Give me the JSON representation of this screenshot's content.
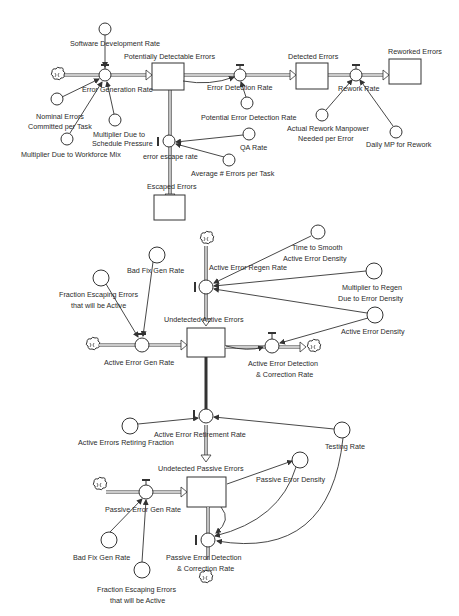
{
  "diagram": {
    "type": "system-dynamics-stock-flow",
    "section_top": {
      "stocks": [
        {
          "id": "pde",
          "label": "Potentially Detectable Errors"
        },
        {
          "id": "de",
          "label": "Detected Errors"
        },
        {
          "id": "re",
          "label": "Reworked Errors"
        },
        {
          "id": "ee",
          "label": "Escaped Errors"
        }
      ],
      "flows": [
        {
          "id": "egr",
          "label": "Error Generation Rate"
        },
        {
          "id": "edr",
          "label": "Error Detection Rate"
        },
        {
          "id": "rr",
          "label": "Rework Rate"
        },
        {
          "id": "eer",
          "label": "error escape rate"
        }
      ],
      "auxiliaries": [
        {
          "id": "sdr",
          "label": "Software Development Rate"
        },
        {
          "id": "necpt_l1",
          "label": "Nominal Errors"
        },
        {
          "id": "necpt_l2",
          "label": "Committed per Task"
        },
        {
          "id": "mdsp_l1",
          "label": "Multiplier Due to"
        },
        {
          "id": "mdsp_l2",
          "label": "Schedule Pressure"
        },
        {
          "id": "mdwm",
          "label": "Multiplier Due to Workforce Mix"
        },
        {
          "id": "pedr",
          "label": "Potential Error Detection Rate"
        },
        {
          "id": "armp_l1",
          "label": "Actual Rework Manpower"
        },
        {
          "id": "armp_l2",
          "label": "Needed per Error"
        },
        {
          "id": "dmp",
          "label": "Daily MP for Rework"
        },
        {
          "id": "qa",
          "label": "QA Rate"
        },
        {
          "id": "aept",
          "label": "Average # Errors per Task"
        }
      ]
    },
    "section_active": {
      "stocks": [
        {
          "id": "uae",
          "label": "Undetected Active Errors"
        }
      ],
      "flows": [
        {
          "id": "aegr",
          "label": "Active Error Gen Rate"
        },
        {
          "id": "aerr",
          "label": "Active Error Regen Rate"
        },
        {
          "id": "aedc_l1",
          "label": "Active Error Detection"
        },
        {
          "id": "aedc_l2",
          "label": "& Correction Rate"
        },
        {
          "id": "aertr",
          "label": "Active Error Retirement Rate"
        }
      ],
      "auxiliaries": [
        {
          "id": "bfgr",
          "label": "Bad Fix Gen Rate"
        },
        {
          "id": "feea_l1",
          "label": "Fraction Escaping Errors"
        },
        {
          "id": "feea_l2",
          "label": "that will be Active"
        },
        {
          "id": "tsaed_l1",
          "label": "Time to Smooth"
        },
        {
          "id": "tsaed_l2",
          "label": "Active Error Density"
        },
        {
          "id": "mrde_l1",
          "label": "Multiplier to Regen"
        },
        {
          "id": "mrde_l2",
          "label": "Due to Error Density"
        },
        {
          "id": "aed",
          "label": "Active Error Density"
        },
        {
          "id": "aerf",
          "label": "Active Errors Retiring Fraction"
        },
        {
          "id": "tr",
          "label": "Testing Rate"
        }
      ]
    },
    "section_passive": {
      "stocks": [
        {
          "id": "upe",
          "label": "Undetected Passive Errors"
        }
      ],
      "flows": [
        {
          "id": "pegr",
          "label": "Passive Error Gen Rate"
        },
        {
          "id": "pedc_l1",
          "label": "Passive Error Detection"
        },
        {
          "id": "pedc_l2",
          "label": "& Correction Rate"
        }
      ],
      "auxiliaries": [
        {
          "id": "ped",
          "label": "Passive Error Density"
        },
        {
          "id": "bfgr2",
          "label": "Bad Fix Gen Rate"
        },
        {
          "id": "feea2_l1",
          "label": "Fraction Escaping Errors"
        },
        {
          "id": "feea2_l2",
          "label": "that will be Active"
        }
      ]
    }
  },
  "labels": {
    "sdr": "Software Development Rate",
    "pde": "Potentially Detectable Errors",
    "egr": "Error Generation Rate",
    "nec1": "Nominal Errors",
    "nec2": "Committed per Task",
    "mdsp1": "Multiplier Due to",
    "mdsp2": "Schedule Pressure",
    "mdwm": "Multiplier Due to Workforce Mix",
    "edr": "Error Detection Rate",
    "pedr": "Potential Error Detection Rate",
    "de": "Detected Errors",
    "re": "Reworked Errors",
    "rr": "Rework Rate",
    "arm1": "Actual Rework Manpower",
    "arm2": "Needed per Error",
    "dmp": "Daily MP for Rework",
    "eer": "error escape rate",
    "qa": "QA Rate",
    "aept": "Average # Errors per Task",
    "ee": "Escaped Errors",
    "bfgr": "Bad Fix Gen Rate",
    "feea1": "Fraction Escaping Errors",
    "feea2": "that will be Active",
    "aerr": "Active Error Regen Rate",
    "ts1": "Time to Smooth",
    "ts2": "Active Error Density",
    "mr1": "Multiplier to Regen",
    "mr2": "Due to Error Density",
    "aed": "Active Error Density",
    "uae": "Undetected Active Errors",
    "aegr": "Active Error Gen Rate",
    "aedc1": "Active Error Detection",
    "aedc2": "& Correction Rate",
    "aertr": "Active Error Retirement Rate",
    "aerf": "Active Errors Retiring Fraction",
    "tr": "Testing Rate",
    "upe": "Undetected Passive Errors",
    "ped": "Passive Error Density",
    "pegr": "Passive Error Gen Rate",
    "bfgr2": "Bad Fix Gen Rate",
    "pedc1": "Passive Error Detection",
    "pedc2": "& Correction Rate",
    "feea2_1": "Fraction Escaping Errors",
    "feea2_2": "that will be Active"
  }
}
